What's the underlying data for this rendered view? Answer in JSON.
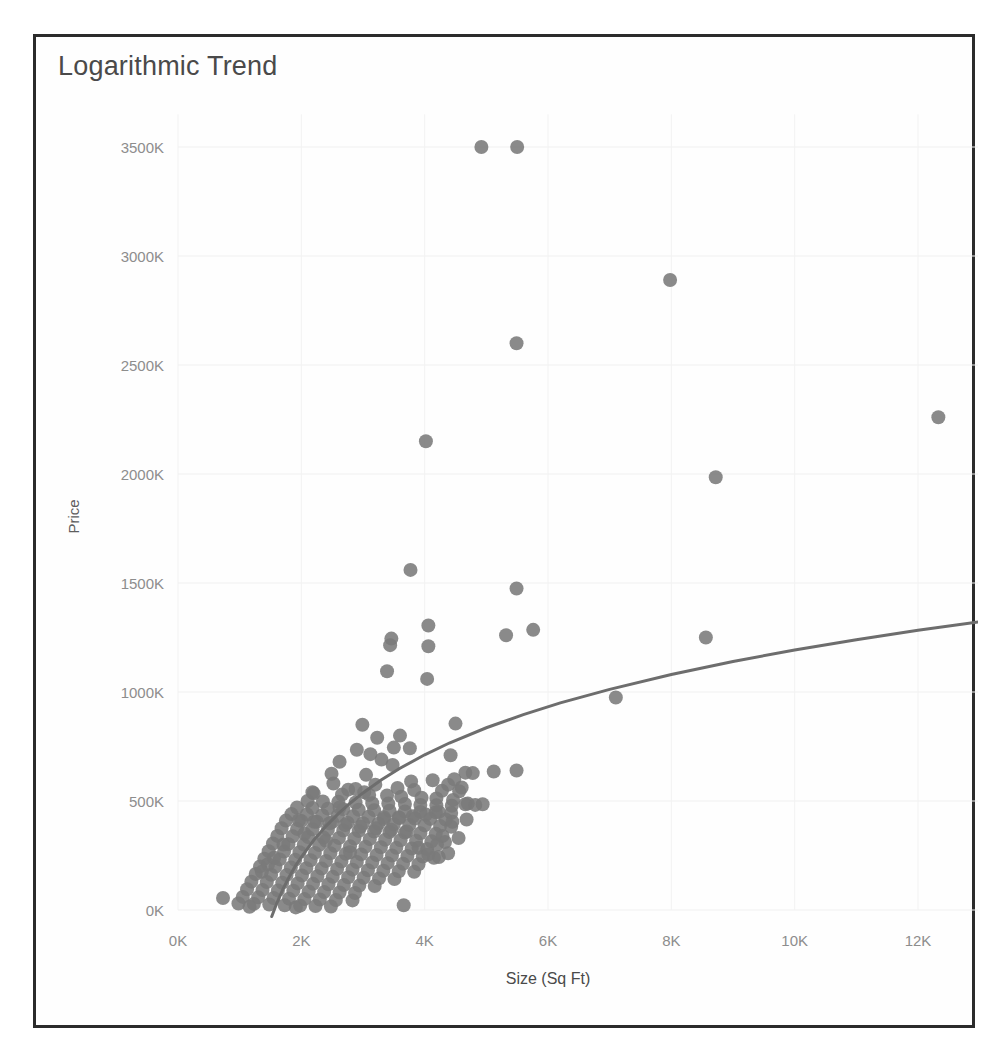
{
  "chart": {
    "title": "Logarithmic Trend"
  },
  "chart_data": {
    "type": "scatter",
    "title": "Logarithmic Trend",
    "xlabel": "Size (Sq Ft)",
    "ylabel": "Price",
    "grid": true,
    "legend": "none",
    "xlim": [
      0,
      13200
    ],
    "ylim": [
      0,
      3650
    ],
    "x_tick_labels": [
      "0K",
      "2K",
      "4K",
      "6K",
      "8K",
      "10K",
      "12K"
    ],
    "x_tick_values": [
      0,
      2000,
      4000,
      6000,
      8000,
      10000,
      12000
    ],
    "y_tick_labels": [
      "0K",
      "500K",
      "1000K",
      "1500K",
      "2000K",
      "2500K",
      "3000K",
      "3500K"
    ],
    "y_tick_values": [
      0,
      500,
      1000,
      1500,
      2000,
      2500,
      3000,
      3500
    ],
    "marker_color": "#7a7a7a",
    "marker_radius": 7,
    "trend": {
      "name": "Logarithmic trend line",
      "color": "#6d6d6d",
      "type": "logarithmic",
      "points": [
        [
          1520,
          -30
        ],
        [
          1600,
          30
        ],
        [
          1700,
          95
        ],
        [
          1800,
          150
        ],
        [
          1900,
          200
        ],
        [
          2000,
          243
        ],
        [
          2200,
          320
        ],
        [
          2400,
          385
        ],
        [
          2600,
          442
        ],
        [
          2800,
          492
        ],
        [
          3000,
          537
        ],
        [
          3300,
          597
        ],
        [
          3600,
          650
        ],
        [
          4000,
          712
        ],
        [
          4400,
          766
        ],
        [
          5000,
          836
        ],
        [
          5600,
          896
        ],
        [
          6200,
          950
        ],
        [
          7000,
          1012
        ],
        [
          8000,
          1080
        ],
        [
          9000,
          1140
        ],
        [
          10000,
          1193
        ],
        [
          11000,
          1240
        ],
        [
          12000,
          1283
        ],
        [
          13000,
          1322
        ]
      ]
    },
    "series": [
      {
        "name": "Homes",
        "points": [
          [
            4920,
            3500
          ],
          [
            5500,
            3500
          ],
          [
            7980,
            2890
          ],
          [
            5490,
            2600
          ],
          [
            12330,
            2260
          ],
          [
            4020,
            2150
          ],
          [
            8720,
            1985
          ],
          [
            3770,
            1560
          ],
          [
            5490,
            1475
          ],
          [
            4060,
            1305
          ],
          [
            5760,
            1285
          ],
          [
            3460,
            1245
          ],
          [
            5320,
            1260
          ],
          [
            8560,
            1250
          ],
          [
            4060,
            1210
          ],
          [
            3440,
            1215
          ],
          [
            3390,
            1095
          ],
          [
            4040,
            1060
          ],
          [
            7100,
            975
          ],
          [
            4500,
            855
          ],
          [
            2990,
            850
          ],
          [
            3600,
            800
          ],
          [
            3230,
            790
          ],
          [
            3500,
            745
          ],
          [
            3760,
            742
          ],
          [
            2900,
            735
          ],
          [
            3120,
            715
          ],
          [
            4420,
            710
          ],
          [
            5490,
            640
          ],
          [
            5120,
            635
          ],
          [
            4660,
            630
          ],
          [
            4780,
            628
          ],
          [
            4480,
            600
          ],
          [
            3780,
            590
          ],
          [
            2520,
            580
          ],
          [
            3200,
            575
          ],
          [
            3560,
            560
          ],
          [
            2760,
            552
          ],
          [
            3830,
            550
          ],
          [
            4280,
            547
          ],
          [
            4560,
            545
          ],
          [
            3020,
            540
          ],
          [
            2200,
            535
          ],
          [
            2660,
            530
          ],
          [
            3100,
            528
          ],
          [
            3390,
            525
          ],
          [
            3620,
            520
          ],
          [
            3950,
            515
          ],
          [
            4190,
            512
          ],
          [
            4460,
            505
          ],
          [
            2100,
            500
          ],
          [
            2350,
            498
          ],
          [
            2600,
            496
          ],
          [
            2880,
            493
          ],
          [
            3150,
            490
          ],
          [
            3410,
            488
          ],
          [
            3680,
            486
          ],
          [
            3930,
            482
          ],
          [
            4190,
            480
          ],
          [
            4440,
            478
          ],
          [
            4700,
            488
          ],
          [
            4940,
            485
          ],
          [
            1930,
            470
          ],
          [
            2180,
            468
          ],
          [
            2430,
            465
          ],
          [
            2680,
            462
          ],
          [
            2930,
            460
          ],
          [
            3180,
            458
          ],
          [
            3430,
            455
          ],
          [
            3680,
            452
          ],
          [
            3930,
            450
          ],
          [
            4180,
            448
          ],
          [
            4430,
            445
          ],
          [
            1840,
            440
          ],
          [
            2090,
            438
          ],
          [
            2340,
            435
          ],
          [
            2590,
            432
          ],
          [
            2840,
            430
          ],
          [
            3090,
            428
          ],
          [
            3340,
            425
          ],
          [
            3590,
            422
          ],
          [
            3840,
            420
          ],
          [
            4090,
            418
          ],
          [
            4340,
            415
          ],
          [
            1750,
            410
          ],
          [
            2000,
            408
          ],
          [
            2250,
            405
          ],
          [
            2500,
            403
          ],
          [
            2750,
            400
          ],
          [
            3000,
            398
          ],
          [
            3250,
            396
          ],
          [
            3500,
            393
          ],
          [
            3750,
            390
          ],
          [
            4000,
            388
          ],
          [
            4250,
            385
          ],
          [
            4430,
            382
          ],
          [
            1680,
            375
          ],
          [
            1930,
            372
          ],
          [
            2180,
            370
          ],
          [
            2430,
            368
          ],
          [
            2680,
            365
          ],
          [
            2930,
            362
          ],
          [
            3180,
            360
          ],
          [
            3430,
            358
          ],
          [
            3680,
            355
          ],
          [
            3930,
            352
          ],
          [
            4180,
            350
          ],
          [
            1610,
            340
          ],
          [
            1860,
            338
          ],
          [
            2110,
            335
          ],
          [
            2360,
            332
          ],
          [
            2610,
            330
          ],
          [
            2860,
            328
          ],
          [
            3110,
            325
          ],
          [
            3360,
            322
          ],
          [
            3610,
            320
          ],
          [
            3860,
            318
          ],
          [
            4110,
            315
          ],
          [
            4330,
            312
          ],
          [
            1540,
            305
          ],
          [
            1790,
            302
          ],
          [
            2040,
            300
          ],
          [
            2290,
            298
          ],
          [
            2540,
            295
          ],
          [
            2790,
            292
          ],
          [
            3040,
            290
          ],
          [
            3290,
            288
          ],
          [
            3540,
            285
          ],
          [
            3790,
            282
          ],
          [
            4040,
            280
          ],
          [
            1470,
            270
          ],
          [
            1720,
            268
          ],
          [
            1970,
            265
          ],
          [
            2220,
            262
          ],
          [
            2470,
            260
          ],
          [
            2720,
            258
          ],
          [
            2970,
            255
          ],
          [
            3220,
            252
          ],
          [
            3470,
            250
          ],
          [
            3720,
            248
          ],
          [
            3970,
            245
          ],
          [
            4230,
            243
          ],
          [
            1400,
            235
          ],
          [
            1650,
            232
          ],
          [
            1900,
            230
          ],
          [
            2150,
            228
          ],
          [
            2400,
            225
          ],
          [
            2650,
            222
          ],
          [
            2900,
            220
          ],
          [
            3150,
            218
          ],
          [
            3400,
            215
          ],
          [
            3650,
            212
          ],
          [
            3900,
            210
          ],
          [
            4150,
            240
          ],
          [
            1330,
            200
          ],
          [
            1580,
            198
          ],
          [
            1830,
            195
          ],
          [
            2080,
            192
          ],
          [
            2330,
            190
          ],
          [
            2580,
            188
          ],
          [
            2830,
            185
          ],
          [
            3080,
            182
          ],
          [
            3330,
            180
          ],
          [
            3580,
            178
          ],
          [
            3830,
            175
          ],
          [
            1260,
            165
          ],
          [
            1510,
            162
          ],
          [
            1760,
            160
          ],
          [
            2010,
            158
          ],
          [
            2260,
            155
          ],
          [
            2510,
            152
          ],
          [
            2760,
            150
          ],
          [
            3010,
            148
          ],
          [
            3260,
            145
          ],
          [
            3510,
            142
          ],
          [
            1190,
            130
          ],
          [
            1440,
            128
          ],
          [
            1690,
            125
          ],
          [
            1940,
            122
          ],
          [
            2190,
            120
          ],
          [
            2440,
            118
          ],
          [
            2690,
            115
          ],
          [
            2940,
            112
          ],
          [
            3190,
            110
          ],
          [
            1120,
            95
          ],
          [
            1370,
            92
          ],
          [
            1620,
            90
          ],
          [
            1870,
            88
          ],
          [
            2120,
            85
          ],
          [
            2370,
            82
          ],
          [
            2620,
            80
          ],
          [
            2870,
            78
          ],
          [
            1050,
            60
          ],
          [
            1300,
            58
          ],
          [
            1550,
            55
          ],
          [
            1800,
            52
          ],
          [
            2050,
            50
          ],
          [
            2300,
            48
          ],
          [
            2560,
            46
          ],
          [
            2830,
            44
          ],
          [
            980,
            30
          ],
          [
            1230,
            28
          ],
          [
            1480,
            25
          ],
          [
            1730,
            22
          ],
          [
            1980,
            20
          ],
          [
            2230,
            18
          ],
          [
            2480,
            16
          ],
          [
            730,
            55
          ],
          [
            3660,
            22
          ],
          [
            1160,
            15
          ],
          [
            1910,
            12
          ],
          [
            2790,
            265
          ],
          [
            2400,
            318
          ],
          [
            2050,
            350
          ],
          [
            2620,
            470
          ],
          [
            3050,
            620
          ],
          [
            2490,
            625
          ],
          [
            2180,
            540
          ],
          [
            4660,
            485
          ],
          [
            4820,
            482
          ],
          [
            4200,
            300
          ],
          [
            3900,
            285
          ],
          [
            4380,
            260
          ],
          [
            4060,
            255
          ],
          [
            4290,
            340
          ],
          [
            4550,
            330
          ],
          [
            4680,
            415
          ],
          [
            4450,
            405
          ],
          [
            2710,
            390
          ],
          [
            2960,
            382
          ],
          [
            3210,
            375
          ],
          [
            3460,
            368
          ],
          [
            3710,
            360
          ],
          [
            2460,
            398
          ],
          [
            2210,
            405
          ],
          [
            1960,
            412
          ],
          [
            1710,
            300
          ],
          [
            1460,
            210
          ],
          [
            1360,
            175
          ],
          [
            1560,
            240
          ],
          [
            2620,
            680
          ],
          [
            2880,
            555
          ],
          [
            3300,
            690
          ],
          [
            3480,
            665
          ],
          [
            4130,
            595
          ],
          [
            4380,
            575
          ],
          [
            4600,
            562
          ],
          [
            4230,
            450
          ],
          [
            4020,
            438
          ],
          [
            3810,
            430
          ],
          [
            3580,
            425
          ],
          [
            3340,
            418
          ]
        ]
      }
    ]
  }
}
